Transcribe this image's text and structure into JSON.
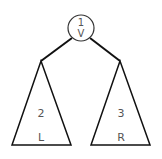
{
  "diagram": {
    "title": "",
    "root": {
      "line1": "1",
      "line2": "V"
    },
    "left_subtree": {
      "number": "2",
      "letter": "L"
    },
    "right_subtree": {
      "number": "3",
      "letter": "R"
    },
    "colors": {
      "stroke": "#111111",
      "text": "#555555",
      "background": "#ffffff"
    }
  }
}
